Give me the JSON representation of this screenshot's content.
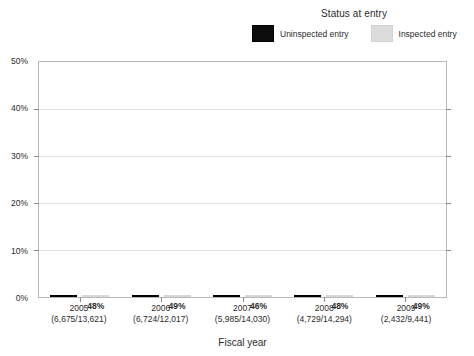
{
  "chart_data": {
    "type": "bar",
    "title": "",
    "xlabel": "Fiscal year",
    "ylabel": "",
    "ylim": [
      0,
      50
    ],
    "ytick_labels": [
      "0%",
      "10%",
      "20%",
      "30%",
      "40%",
      "50%"
    ],
    "ytick_values": [
      0,
      10,
      20,
      30,
      40,
      50
    ],
    "grid": true,
    "legend_position": "top-right",
    "legend_title": "Status at entry",
    "categories": [
      "2005",
      "2006",
      "2007",
      "2008",
      "2009"
    ],
    "category_sublabels": [
      "(6,675/13,621)",
      "(6,724/12,017)",
      "(5,985/14,030)",
      "(4,729/14,294)",
      "(2,432/9,441)"
    ],
    "series": [
      {
        "name": "Uninspected entry",
        "color": "#0d0d0d",
        "values": [
          37,
          32,
          26,
          29,
          36
        ],
        "labels": [
          "37%",
          "32%",
          "26%",
          "29%",
          "36%"
        ]
      },
      {
        "name": "Inspected entry",
        "color": "#dcdcdc",
        "values": [
          48,
          49,
          46,
          48,
          49
        ],
        "labels": [
          "48%",
          "49%",
          "46%",
          "48%",
          "49%"
        ]
      }
    ]
  },
  "legend": {
    "title": "Status at entry",
    "items": [
      {
        "label": "Uninspected entry",
        "swatch": "dark-swatch-icon"
      },
      {
        "label": "Inspected entry",
        "swatch": "light-swatch-icon"
      }
    ]
  },
  "axes": {
    "x_title": "Fiscal year",
    "y_ticks": [
      "50%",
      "40%",
      "30%",
      "20%",
      "10%",
      "0%"
    ]
  }
}
